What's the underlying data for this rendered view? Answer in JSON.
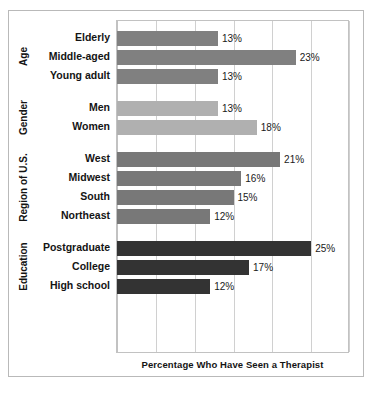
{
  "chart_data": {
    "type": "bar",
    "orientation": "horizontal",
    "title": "",
    "xlabel": "Percentage Who Have Seen a Therapist",
    "ylabel": "",
    "xlim": [
      0,
      30
    ],
    "grid": true,
    "gridline_values": [
      0,
      5,
      10,
      15,
      20,
      25,
      30
    ],
    "legend_position": "none",
    "value_suffix": "%",
    "categories": [
      "Elderly",
      "Middle-aged",
      "Young adult",
      "Men",
      "Women",
      "West",
      "Midwest",
      "South",
      "Northeast",
      "Postgraduate",
      "College",
      "High school"
    ],
    "values": [
      13,
      23,
      13,
      13,
      18,
      21,
      16,
      15,
      12,
      25,
      17,
      12
    ],
    "value_labels": [
      "13%",
      "23%",
      "13%",
      "13%",
      "18%",
      "21%",
      "16%",
      "15%",
      "12%",
      "25%",
      "17%",
      "12%"
    ],
    "groups": [
      {
        "name": "Age",
        "color": "#808080",
        "items": [
          {
            "label": "Elderly",
            "value": 13,
            "value_label": "13%"
          },
          {
            "label": "Middle-aged",
            "value": 23,
            "value_label": "23%"
          },
          {
            "label": "Young adult",
            "value": 13,
            "value_label": "13%"
          }
        ]
      },
      {
        "name": "Gender",
        "color": "#b0b0b0",
        "items": [
          {
            "label": "Men",
            "value": 13,
            "value_label": "13%"
          },
          {
            "label": "Women",
            "value": 18,
            "value_label": "18%"
          }
        ]
      },
      {
        "name": "Region of U.S.",
        "color": "#787878",
        "items": [
          {
            "label": "West",
            "value": 21,
            "value_label": "21%"
          },
          {
            "label": "Midwest",
            "value": 16,
            "value_label": "16%"
          },
          {
            "label": "South",
            "value": 15,
            "value_label": "15%"
          },
          {
            "label": "Northeast",
            "value": 12,
            "value_label": "12%"
          }
        ]
      },
      {
        "name": "Education",
        "color": "#333333",
        "items": [
          {
            "label": "Postgraduate",
            "value": 25,
            "value_label": "25%"
          },
          {
            "label": "College",
            "value": 17,
            "value_label": "17%"
          },
          {
            "label": "High school",
            "value": 12,
            "value_label": "12%"
          }
        ]
      }
    ]
  }
}
